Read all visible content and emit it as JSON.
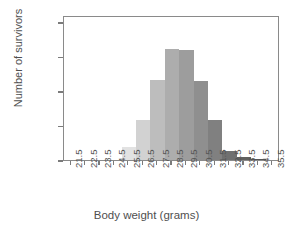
{
  "chart_data": {
    "type": "bar",
    "title": "",
    "subtitle": "",
    "xlabel": "Body weight (grams)",
    "ylabel": "Number of survivors",
    "grid": false,
    "legend": null,
    "legend_position": "none",
    "xlim": [
      21.0,
      36.0
    ],
    "ylim": [
      0,
      420
    ],
    "yticks": [
      0,
      100,
      200,
      300,
      400
    ],
    "ytick_labels": [
      "0",
      "100",
      "200",
      "300",
      "400"
    ],
    "xticks": [
      21.5,
      22.5,
      23.5,
      24.5,
      25.5,
      26.5,
      27.5,
      28.5,
      29.5,
      30.5,
      31.5,
      32.5,
      33.5,
      34.5,
      35.5
    ],
    "xtick_labels": [
      "21.5",
      "22.5",
      "23.5",
      "24.5",
      "25.5",
      "26.5",
      "27.5",
      "28.5",
      "29.5",
      "30.5",
      "31.5",
      "32.5",
      "33.5",
      "34.5",
      "35.5"
    ],
    "bin_width": 1.0,
    "categories": [
      "21.5",
      "22.5",
      "23.5",
      "24.5",
      "25.5",
      "26.5",
      "27.5",
      "28.5",
      "29.5",
      "30.5",
      "31.5",
      "32.5",
      "33.5",
      "34.5",
      "35.5"
    ],
    "values": [
      0,
      0,
      0,
      0,
      38,
      117,
      233,
      322,
      319,
      228,
      117,
      27,
      8,
      3,
      0
    ],
    "bar_colors": [
      "#ffffff",
      "#ffffff",
      "#ffffff",
      "#ffffff",
      "#e2e2e2",
      "#d2d2d2",
      "#bdbdbd",
      "#adadad",
      "#9d9d9d",
      "#8f8f8f",
      "#808080",
      "#707070",
      "#606060",
      "#555555",
      "#ffffff"
    ],
    "axis_color": "#8a8a8a",
    "text_color": "#4f4f4f"
  }
}
